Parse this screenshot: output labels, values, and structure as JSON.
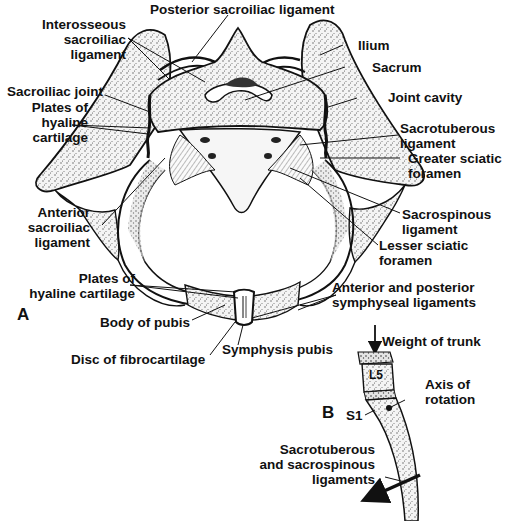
{
  "figure": {
    "panel_a": {
      "letter": "A",
      "labels": {
        "posterior_sacroiliac_ligament": "Posterior sacroiliac ligament",
        "interosseous_sacroiliac_ligament": [
          "Interosseous",
          "sacroiliac",
          "ligament"
        ],
        "ilium": "Ilium",
        "sacrum": "Sacrum",
        "sacroiliac_joint": "Sacroiliac joint",
        "plates_hyaline_upper": [
          "Plates of",
          "hyaline",
          "cartilage"
        ],
        "joint_cavity": "Joint cavity",
        "sacrotuberous_ligament": [
          "Sacrotuberous",
          "ligament"
        ],
        "greater_sciatic_foramen": [
          "Greater sciatic",
          "foramen"
        ],
        "anterior_sacroiliac_ligament": [
          "Anterior",
          "sacroiliac",
          "ligament"
        ],
        "sacrospinous_ligament": [
          "Sacrospinous",
          "ligament"
        ],
        "lesser_sciatic_foramen": [
          "Lesser sciatic",
          "foramen"
        ],
        "plates_hyaline_lower": [
          "Plates of",
          "hyaline cartilage"
        ],
        "anterior_posterior_symphyseal": [
          "Anterior and posterior",
          "symphyseal ligaments"
        ],
        "body_of_pubis": "Body of pubis",
        "disc_of_fibrocartilage": "Disc of fibrocartilage",
        "symphysis_pubis": "Symphysis pubis"
      }
    },
    "panel_b": {
      "letter": "B",
      "labels": {
        "weight_of_trunk": "Weight of trunk",
        "l5": "L5",
        "axis_of_rotation": [
          "Axis of",
          "rotation"
        ],
        "s1": "S1",
        "sacro_ligaments": [
          "Sacrotuberous",
          "and sacrospinous",
          "ligaments"
        ]
      }
    }
  }
}
